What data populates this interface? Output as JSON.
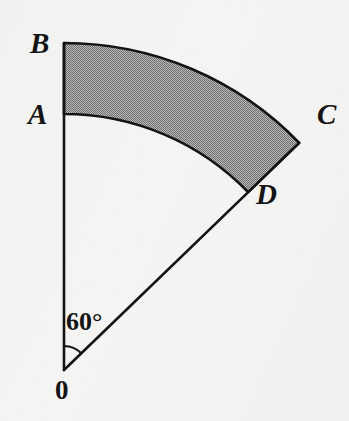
{
  "figure": {
    "kind": "geometry-diagram",
    "background_color": "#f4f4f3",
    "stroke_color": "#141414",
    "shade_color": "#9a9a9a",
    "width": 349,
    "height": 421
  },
  "labels": {
    "origin": "0",
    "inner_start": "A",
    "outer_start": "B",
    "outer_end": "C",
    "inner_end": "D",
    "angle": "60°"
  },
  "geometry": {
    "center": {
      "x": 64,
      "y": 370
    },
    "inner_radius": 256,
    "outer_radius": 327,
    "start_angle_deg": 0,
    "sweep_angle_deg": 46,
    "angle_marker_radius": 24,
    "points": {
      "O": {
        "x": 64,
        "y": 370
      },
      "A": {
        "x": 64,
        "y": 114
      },
      "B": {
        "x": 64,
        "y": 43
      },
      "C": {
        "x": 306,
        "y": 121
      },
      "D": {
        "x": 248,
        "y": 178
      }
    }
  },
  "label_positions": {
    "B": {
      "x": 30,
      "y": 29
    },
    "A": {
      "x": 28,
      "y": 100
    },
    "C": {
      "x": 317,
      "y": 100
    },
    "D": {
      "x": 256,
      "y": 180
    },
    "angle": {
      "x": 66,
      "y": 309
    },
    "origin": {
      "x": 55,
      "y": 377
    }
  }
}
